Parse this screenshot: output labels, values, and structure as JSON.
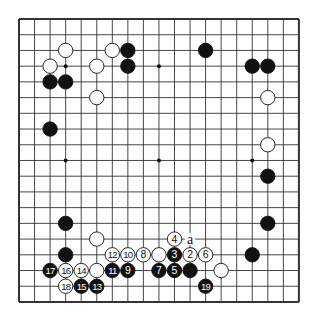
{
  "board": {
    "size": 19,
    "origin_x": 19,
    "origin_y": 19,
    "spacing_x": 15.55,
    "spacing_y": 15.72,
    "line_color": "#333333",
    "border_width": 2,
    "star_points": [
      [
        3,
        3
      ],
      [
        3,
        9
      ],
      [
        3,
        15
      ],
      [
        9,
        3
      ],
      [
        9,
        9
      ],
      [
        9,
        15
      ],
      [
        15,
        3
      ],
      [
        15,
        9
      ],
      [
        15,
        15
      ]
    ]
  },
  "stones": [
    {
      "color": "white",
      "col": 3,
      "row": 2
    },
    {
      "color": "white",
      "col": 2,
      "row": 3
    },
    {
      "color": "black",
      "col": 2,
      "row": 4
    },
    {
      "color": "black",
      "col": 3,
      "row": 4
    },
    {
      "color": "white",
      "col": 5,
      "row": 3
    },
    {
      "color": "white",
      "col": 5,
      "row": 5
    },
    {
      "color": "white",
      "col": 6,
      "row": 2
    },
    {
      "color": "black",
      "col": 7,
      "row": 2
    },
    {
      "color": "black",
      "col": 7,
      "row": 3
    },
    {
      "color": "black",
      "col": 2,
      "row": 7
    },
    {
      "color": "black",
      "col": 12,
      "row": 2
    },
    {
      "color": "black",
      "col": 15,
      "row": 3
    },
    {
      "color": "black",
      "col": 16,
      "row": 3
    },
    {
      "color": "white",
      "col": 16,
      "row": 5
    },
    {
      "color": "white",
      "col": 16,
      "row": 8
    },
    {
      "color": "black",
      "col": 16,
      "row": 10
    },
    {
      "color": "black",
      "col": 16,
      "row": 13
    },
    {
      "color": "black",
      "col": 15,
      "row": 15
    },
    {
      "color": "black",
      "col": 3,
      "row": 13
    },
    {
      "color": "white",
      "col": 5,
      "row": 14
    },
    {
      "color": "black",
      "col": 3,
      "row": 15
    },
    {
      "color": "white",
      "col": 5,
      "row": 16
    },
    {
      "color": "white",
      "col": 9,
      "row": 15
    },
    {
      "color": "black",
      "col": 11,
      "row": 16
    },
    {
      "color": "white",
      "col": 13,
      "row": 16
    }
  ],
  "moves": [
    {
      "num": "2",
      "color": "white",
      "col": 11,
      "row": 15
    },
    {
      "num": "3",
      "color": "black",
      "col": 10,
      "row": 15
    },
    {
      "num": "4",
      "color": "white",
      "col": 10,
      "row": 14
    },
    {
      "num": "5",
      "color": "black",
      "col": 10,
      "row": 16
    },
    {
      "num": "6",
      "color": "white",
      "col": 12,
      "row": 15
    },
    {
      "num": "7",
      "color": "black",
      "col": 9,
      "row": 16
    },
    {
      "num": "8",
      "color": "white",
      "col": 8,
      "row": 15
    },
    {
      "num": "9",
      "color": "black",
      "col": 7,
      "row": 16
    },
    {
      "num": "10",
      "color": "white",
      "col": 7,
      "row": 15
    },
    {
      "num": "11",
      "color": "black",
      "col": 6,
      "row": 16
    },
    {
      "num": "12",
      "color": "white",
      "col": 6,
      "row": 15
    },
    {
      "num": "13",
      "color": "black",
      "col": 5,
      "row": 17
    },
    {
      "num": "14",
      "color": "white",
      "col": 4,
      "row": 16
    },
    {
      "num": "15",
      "color": "black",
      "col": 4,
      "row": 17
    },
    {
      "num": "16",
      "color": "white",
      "col": 3,
      "row": 16
    },
    {
      "num": "17",
      "color": "black",
      "col": 2,
      "row": 16
    },
    {
      "num": "18",
      "color": "white",
      "col": 3,
      "row": 17
    },
    {
      "num": "19",
      "color": "black",
      "col": 12,
      "row": 17
    }
  ],
  "labels": [
    {
      "text": "a",
      "col": 11,
      "row": 14
    }
  ]
}
